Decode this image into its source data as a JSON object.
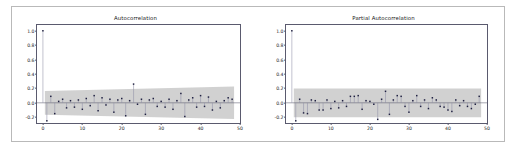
{
  "figure": {
    "background_color": "#ffffff",
    "frame_color": "#b9b9b9",
    "axes_edge_color": "#5a5a6e",
    "band_color": "#cfcfcf",
    "marker_color": "#1f2040",
    "stem_color": "#8d8da6",
    "zero_line_color": "#4a4a5e"
  },
  "chart_data": [
    {
      "type": "bar",
      "name": "autocorrelation",
      "title": "Autocorrelation",
      "xlabel": "",
      "ylabel": "",
      "xlim": [
        -1.5,
        50
      ],
      "ylim": [
        -0.28,
        1.08
      ],
      "grid": false,
      "legend": "none",
      "xticks": [
        0,
        10,
        20,
        30,
        40,
        50
      ],
      "xtick_labels": [
        "0",
        "10",
        "20",
        "30",
        "40",
        "50"
      ],
      "yticks": [
        -0.2,
        0.0,
        0.2,
        0.4,
        0.6,
        0.8,
        1.0
      ],
      "ytick_labels": [
        "-0.2",
        "0.0",
        "0.2",
        "0.4",
        "0.6",
        "0.8",
        "1.0"
      ],
      "confidence_band": {
        "style": "widening",
        "upper_start": 0.165,
        "upper_end": 0.225,
        "lower_start": -0.165,
        "lower_end": -0.225,
        "x_start": 0.5,
        "x_end": 48.5
      },
      "x": [
        0,
        1,
        2,
        3,
        4,
        5,
        6,
        7,
        8,
        9,
        10,
        11,
        12,
        13,
        14,
        15,
        16,
        17,
        18,
        19,
        20,
        21,
        22,
        23,
        24,
        25,
        26,
        27,
        28,
        29,
        30,
        31,
        32,
        33,
        34,
        35,
        36,
        37,
        38,
        39,
        40,
        41,
        42,
        43,
        44,
        45,
        46,
        47,
        48
      ],
      "values": [
        1.0,
        -0.25,
        0.09,
        -0.15,
        0.02,
        0.05,
        -0.07,
        0.03,
        -0.06,
        0.04,
        -0.09,
        0.06,
        -0.04,
        0.1,
        -0.11,
        0.07,
        -0.03,
        0.05,
        -0.13,
        0.04,
        0.06,
        -0.18,
        0.03,
        0.26,
        -0.02,
        0.05,
        -0.16,
        0.04,
        0.06,
        -0.05,
        0.02,
        -0.06,
        0.05,
        -0.09,
        0.03,
        0.13,
        -0.19,
        0.04,
        0.07,
        -0.06,
        0.1,
        -0.05,
        0.08,
        -0.1,
        0.02,
        -0.07,
        0.03,
        0.07,
        0.05
      ]
    },
    {
      "type": "bar",
      "name": "partial-autocorrelation",
      "title": "Partial Autocorrelation",
      "xlabel": "",
      "ylabel": "",
      "xlim": [
        -1.5,
        50
      ],
      "ylim": [
        -0.28,
        1.08
      ],
      "grid": false,
      "legend": "none",
      "xticks": [
        0,
        10,
        20,
        30,
        40,
        50
      ],
      "xtick_labels": [
        "0",
        "10",
        "20",
        "30",
        "40",
        "50"
      ],
      "yticks": [
        -0.2,
        0.0,
        0.2,
        0.4,
        0.6,
        0.8,
        1.0
      ],
      "ytick_labels": [
        "-0.2",
        "0.0",
        "0.2",
        "0.4",
        "0.6",
        "0.8",
        "1.0"
      ],
      "confidence_band": {
        "style": "constant",
        "upper_start": 0.2,
        "upper_end": 0.2,
        "lower_start": -0.2,
        "lower_end": -0.2,
        "x_start": 0.5,
        "x_end": 48.5
      },
      "x": [
        0,
        1,
        2,
        3,
        4,
        5,
        6,
        7,
        8,
        9,
        10,
        11,
        12,
        13,
        14,
        15,
        16,
        17,
        18,
        19,
        20,
        21,
        22,
        23,
        24,
        25,
        26,
        27,
        28,
        29,
        30,
        31,
        32,
        33,
        34,
        35,
        36,
        37,
        38,
        39,
        40,
        41,
        42,
        43,
        44,
        45,
        46,
        47,
        48
      ],
      "values": [
        1.0,
        -0.25,
        0.05,
        -0.14,
        -0.15,
        0.04,
        0.03,
        -0.1,
        -0.1,
        0.04,
        -0.08,
        0.02,
        -0.07,
        0.03,
        -0.05,
        0.09,
        0.09,
        0.1,
        -0.09,
        0.03,
        0.02,
        -0.02,
        -0.23,
        0.05,
        0.16,
        -0.16,
        0.04,
        0.1,
        0.09,
        -0.05,
        -0.13,
        0.03,
        0.1,
        -0.05,
        0.04,
        -0.08,
        0.07,
        0.04,
        -0.05,
        -0.06,
        -0.1,
        -0.12,
        0.04,
        -0.04,
        0.03,
        -0.05,
        -0.08,
        -0.02,
        0.09
      ]
    }
  ]
}
